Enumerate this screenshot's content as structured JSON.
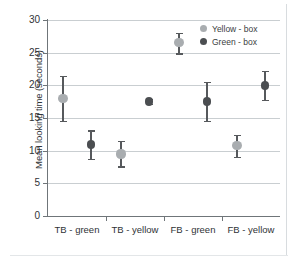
{
  "chart_data": {
    "type": "scatter",
    "title": "",
    "xlabel": "",
    "ylabel": "Mean looking time (seconds)",
    "categories": [
      "TB - green",
      "TB - yellow",
      "FB - green",
      "FB - yellow"
    ],
    "ylim": [
      0,
      30
    ],
    "yticks": [
      0,
      5,
      10,
      15,
      20,
      25,
      30
    ],
    "ytick_labels": [
      "0",
      "5",
      "10",
      "15",
      "20",
      "25",
      "30"
    ],
    "grid": true,
    "legend_position": "top-right",
    "series": [
      {
        "name": "Yellow - box",
        "color": "#a9adb0",
        "values": [
          18.0,
          9.5,
          26.5,
          10.8
        ],
        "err_low": [
          14.5,
          7.6,
          24.9,
          9.0
        ],
        "err_high": [
          21.5,
          11.5,
          28.0,
          12.4
        ]
      },
      {
        "name": "Green - box",
        "color": "#4b4e51",
        "values": [
          10.9,
          17.5,
          17.5,
          20.0
        ],
        "err_low": [
          8.7,
          17.1,
          14.5,
          17.8
        ],
        "err_high": [
          13.1,
          17.9,
          20.5,
          22.2
        ]
      }
    ]
  },
  "axes": {
    "ylabel": "Mean looking time (seconds)",
    "ytick_labels": [
      "30",
      "25",
      "20",
      "15",
      "10",
      "5",
      "0"
    ],
    "xtick_labels": [
      "TB - green",
      "TB - yellow",
      "FB - green",
      "FB - yellow"
    ]
  },
  "legend": {
    "items": [
      {
        "label": "Yellow - box",
        "color": "#a9adb0"
      },
      {
        "label": "Green - box",
        "color": "#4b4e51"
      }
    ]
  }
}
